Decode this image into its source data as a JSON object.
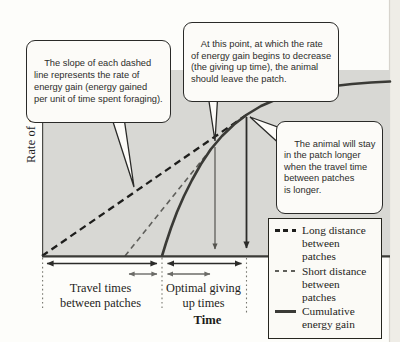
{
  "figure": {
    "y_axis_label": "Rate of energy gain",
    "x_axis_label": "Time",
    "travel_label": "Travel times\nbetween patches",
    "giving_up_label": "Optimal giving\nup times"
  },
  "callouts": {
    "slope": "The slope of each dashed\nline represents the rate of\nenergy gain (energy gained\nper unit of time spent foraging).",
    "leave_patch": "At this point, at which the rate\nof energy gain begins to decrease\n(the giving up time), the animal\nshould leave the patch.",
    "stay_longer": "The animal will stay\nin the patch longer\nwhen the travel time\nbetween patches\nis longer."
  },
  "legend": {
    "items": [
      {
        "label": "Long distance\nbetween patches",
        "style": "dashed-bold"
      },
      {
        "label": "Short distance\nbetween patches",
        "style": "dashed-thin"
      },
      {
        "label": "Cumulative\nenergy gain",
        "style": "solid"
      }
    ]
  },
  "colors": {
    "plot_background": "#d8d8d4",
    "long_distance_line": "#1e1e1c",
    "short_distance_line": "#5f5f5b",
    "cumulative_curve": "#3a3a36",
    "axis": "#3b3b37",
    "callout_background": "#fcfbf8",
    "text": "#1c1c1a"
  },
  "chart_data": {
    "type": "line",
    "title": "",
    "xlabel": "Time",
    "ylabel": "Rate of energy gain",
    "numeric_axes": false,
    "grid": false,
    "legend_position": "lower-right",
    "series": [
      {
        "name": "Cumulative energy gain",
        "style": "solid",
        "points_px": [
          [
            162,
            256
          ],
          [
            166,
            243
          ],
          [
            171,
            228
          ],
          [
            177,
            212
          ],
          [
            184,
            196
          ],
          [
            192,
            180
          ],
          [
            201,
            164
          ],
          [
            211,
            149
          ],
          [
            222,
            136
          ],
          [
            234,
            124.5
          ],
          [
            247,
            114.5
          ],
          [
            261,
            106
          ],
          [
            276,
            99.5
          ],
          [
            292,
            94
          ],
          [
            310,
            90
          ],
          [
            330,
            86.5
          ],
          [
            352,
            84
          ],
          [
            371,
            82.5
          ],
          [
            390,
            81.5
          ]
        ]
      },
      {
        "name": "Long distance between patches",
        "style": "dashed-bold",
        "points_px": [
          [
            42,
            256
          ],
          [
            247,
            114.5
          ]
        ]
      },
      {
        "name": "Short distance between patches",
        "style": "dashed-thin",
        "points_px": [
          [
            125,
            256
          ],
          [
            215,
            144
          ]
        ]
      }
    ],
    "annotations": {
      "patch_entry_x_px": 162,
      "travel_start_long_x_px": 42,
      "travel_start_short_x_px": 125,
      "giving_up_short_x_px": 215,
      "giving_up_long_x_px": 246.5
    }
  }
}
